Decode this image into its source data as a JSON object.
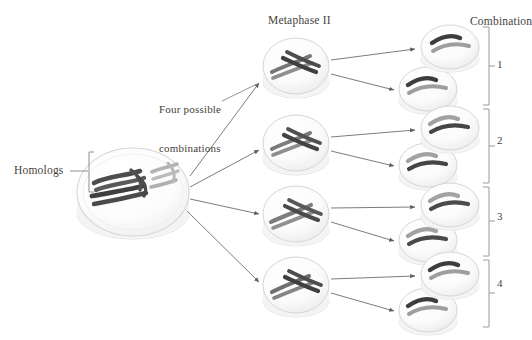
{
  "diagram": {
    "title_labels": {
      "homologs": "Homologs",
      "four_possible_combinations_line1": "Four possible",
      "four_possible_combinations_line2": "combinations",
      "metaphase_two": "Metaphase II",
      "combination": "Combination"
    },
    "combination_numbers": [
      "1",
      "2",
      "3",
      "4"
    ],
    "colors": {
      "chromosome_dark": "#4a4a4a",
      "chromosome_light": "#b8b8b8",
      "cell_fill": "#fbfbfb",
      "cell_edge": "#d8d8d8",
      "cell_shadow": "#e8e8e8",
      "arrow": "#6b6b6b",
      "text": "#443f3a",
      "bracket": "#9a9a9a"
    },
    "parent_cell": {
      "name": "parent-cell",
      "cx": 133,
      "cy": 192,
      "rx": 56,
      "ry": 44,
      "chromosomes": [
        {
          "kind": "dark-long-pair",
          "shade": "dark"
        },
        {
          "kind": "light-short-pair",
          "shade": "light"
        }
      ]
    },
    "metaphase_cells": [
      {
        "id": "metaphase-cell-1",
        "cx": 296,
        "cy": 66,
        "rx": 33,
        "ry": 28,
        "top_chromosome": "dark",
        "bottom_chromosome": "light"
      },
      {
        "id": "metaphase-cell-2",
        "cx": 296,
        "cy": 143,
        "rx": 33,
        "ry": 28,
        "top_chromosome": "light",
        "bottom_chromosome": "dark"
      },
      {
        "id": "metaphase-cell-3",
        "cx": 296,
        "cy": 214,
        "rx": 33,
        "ry": 28,
        "top_chromosome": "light",
        "bottom_chromosome": "dark"
      },
      {
        "id": "metaphase-cell-4",
        "cx": 296,
        "cy": 285,
        "rx": 33,
        "ry": 28,
        "top_chromosome": "dark",
        "bottom_chromosome": "light"
      }
    ],
    "gamete_cells": [
      {
        "id": "gamete-cell-1",
        "cx": 450,
        "cy": 47,
        "rx": 29,
        "ry": 22,
        "combination": "1",
        "bars": [
          "dark",
          "light"
        ]
      },
      {
        "id": "gamete-cell-2",
        "cx": 428,
        "cy": 89,
        "rx": 29,
        "ry": 22,
        "combination": "1",
        "bars": [
          "dark",
          "light"
        ]
      },
      {
        "id": "gamete-cell-3",
        "cx": 450,
        "cy": 128,
        "rx": 29,
        "ry": 22,
        "combination": "2",
        "bars": [
          "light",
          "dark"
        ]
      },
      {
        "id": "gamete-cell-4",
        "cx": 428,
        "cy": 165,
        "rx": 29,
        "ry": 22,
        "combination": "2",
        "bars": [
          "light",
          "dark"
        ]
      },
      {
        "id": "gamete-cell-5",
        "cx": 450,
        "cy": 205,
        "rx": 29,
        "ry": 22,
        "combination": "3",
        "bars": [
          "light",
          "dark"
        ]
      },
      {
        "id": "gamete-cell-6",
        "cx": 428,
        "cy": 240,
        "rx": 29,
        "ry": 22,
        "combination": "3",
        "bars": [
          "light",
          "dark"
        ]
      },
      {
        "id": "gamete-cell-7",
        "cx": 450,
        "cy": 274,
        "rx": 29,
        "ry": 22,
        "combination": "4",
        "bars": [
          "dark",
          "light"
        ]
      },
      {
        "id": "gamete-cell-8",
        "cx": 428,
        "cy": 310,
        "rx": 29,
        "ry": 22,
        "combination": "4",
        "bars": [
          "dark",
          "light"
        ]
      }
    ],
    "brackets": [
      {
        "id": "bracket-combination-1",
        "x": 487,
        "y_top": 26,
        "y_bottom": 105,
        "label": "1"
      },
      {
        "id": "bracket-combination-2",
        "x": 487,
        "y_top": 108,
        "y_bottom": 183,
        "label": "2"
      },
      {
        "id": "bracket-combination-3",
        "x": 487,
        "y_top": 186,
        "y_bottom": 256,
        "label": "3"
      },
      {
        "id": "bracket-combination-4",
        "x": 487,
        "y_top": 259,
        "y_bottom": 327,
        "label": "4"
      }
    ],
    "arrows_parent_to_metaphase": [
      {
        "id": "arrow-parent-to-m1",
        "x1": 190,
        "y1": 175,
        "x2": 262,
        "y2": 82
      },
      {
        "id": "arrow-parent-to-m2",
        "x1": 190,
        "y1": 186,
        "x2": 262,
        "y2": 149
      },
      {
        "id": "arrow-parent-to-m3",
        "x1": 190,
        "y1": 198,
        "x2": 262,
        "y2": 214
      },
      {
        "id": "arrow-parent-to-m4",
        "x1": 188,
        "y1": 210,
        "x2": 262,
        "y2": 281
      }
    ],
    "arrows_metaphase_to_gamete": [
      {
        "id": "arrow-m1-to-g1",
        "x1": 332,
        "y1": 60,
        "x2": 417,
        "y2": 48
      },
      {
        "id": "arrow-m1-to-g2",
        "x1": 332,
        "y1": 73,
        "x2": 396,
        "y2": 90
      },
      {
        "id": "arrow-m2-to-g3",
        "x1": 332,
        "y1": 136,
        "x2": 417,
        "y2": 129
      },
      {
        "id": "arrow-m2-to-g4",
        "x1": 332,
        "y1": 150,
        "x2": 396,
        "y2": 166
      },
      {
        "id": "arrow-m3-to-g5",
        "x1": 332,
        "y1": 207,
        "x2": 417,
        "y2": 206
      },
      {
        "id": "arrow-m4-to-g6",
        "x1": 332,
        "y1": 221,
        "x2": 396,
        "y2": 241
      },
      {
        "id": "arrow-m4-to-g7",
        "x1": 332,
        "y1": 278,
        "x2": 417,
        "y2": 275
      },
      {
        "id": "arrow-m4-to-g8",
        "x1": 332,
        "y1": 292,
        "x2": 396,
        "y2": 311
      }
    ],
    "leader_lines": [
      {
        "id": "leader-homologs",
        "x1": 71,
        "y1": 170,
        "x2": 88,
        "y2": 170
      },
      {
        "id": "leader-four-combinations",
        "x1": 222,
        "y1": 100,
        "x2": 258,
        "y2": 84
      }
    ],
    "homolog_bracket": {
      "id": "homolog-bracket",
      "x": 90,
      "y_top": 152,
      "y_bottom": 192
    }
  }
}
